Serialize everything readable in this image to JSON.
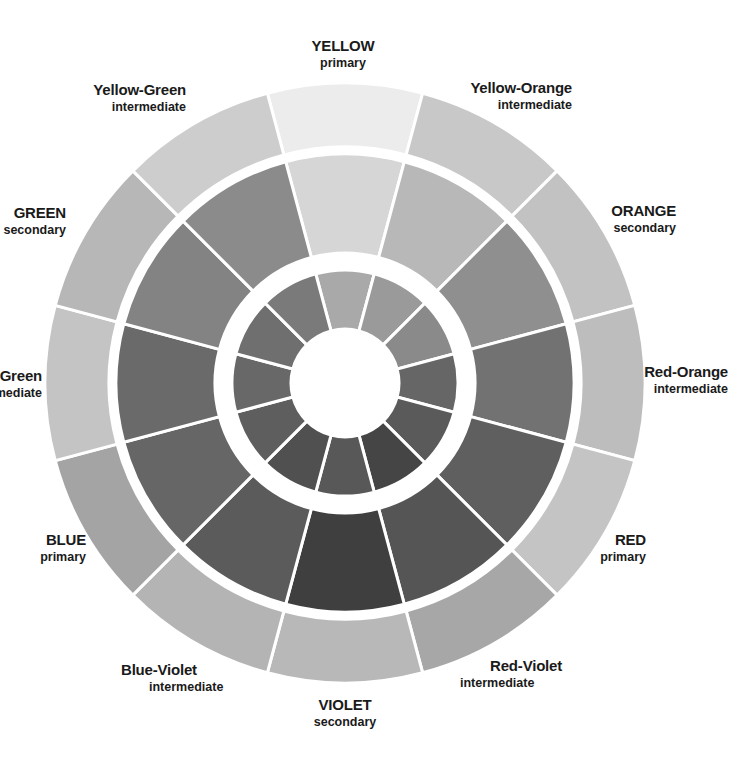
{
  "wheel": {
    "center": [
      345,
      383
    ],
    "rings": {
      "outer": {
        "r_outer": 300,
        "r_inner": 236
      },
      "middle": {
        "r_outer": 229,
        "r_inner": 130
      },
      "inner": {
        "r_outer": 113,
        "r_inner": 54
      }
    },
    "segment_count": 12,
    "segments": [
      {
        "name": "YELLOW",
        "kind": "primary",
        "angle": 0,
        "colors": {
          "outer": "#ececec",
          "middle": "#d6d6d6",
          "inner": "#a9a9a9"
        }
      },
      {
        "name": "Yellow-Orange",
        "kind": "intermediate",
        "angle": 30,
        "colors": {
          "outer": "#c8c8c8",
          "middle": "#b8b8b8",
          "inner": "#9a9a9a"
        }
      },
      {
        "name": "ORANGE",
        "kind": "secondary",
        "angle": 60,
        "colors": {
          "outer": "#c2c2c2",
          "middle": "#8f8f8f",
          "inner": "#8a8a8a"
        }
      },
      {
        "name": "Red-Orange",
        "kind": "intermediate",
        "angle": 90,
        "colors": {
          "outer": "#bdbdbd",
          "middle": "#727272",
          "inner": "#666666"
        }
      },
      {
        "name": "RED",
        "kind": "primary",
        "angle": 120,
        "colors": {
          "outer": "#c4c4c4",
          "middle": "#5f5f5f",
          "inner": "#5a5a5a"
        }
      },
      {
        "name": "Red-Violet",
        "kind": "intermediate",
        "angle": 150,
        "colors": {
          "outer": "#a7a7a7",
          "middle": "#555555",
          "inner": "#454545"
        }
      },
      {
        "name": "VIOLET",
        "kind": "secondary",
        "angle": 180,
        "colors": {
          "outer": "#b8b8b8",
          "middle": "#3f3f3f",
          "inner": "#585858"
        }
      },
      {
        "name": "Blue-Violet",
        "kind": "intermediate",
        "angle": 210,
        "colors": {
          "outer": "#b4b4b4",
          "middle": "#5b5b5b",
          "inner": "#505050"
        }
      },
      {
        "name": "BLUE",
        "kind": "primary",
        "angle": 240,
        "colors": {
          "outer": "#a4a4a4",
          "middle": "#666666",
          "inner": "#5e5e5e"
        }
      },
      {
        "name": "Blue-Green",
        "kind": "intermediate",
        "angle": 270,
        "colors": {
          "outer": "#c4c4c4",
          "middle": "#6a6a6a",
          "inner": "#686868"
        }
      },
      {
        "name": "GREEN",
        "kind": "secondary",
        "angle": 300,
        "colors": {
          "outer": "#b7b7b7",
          "middle": "#838383",
          "inner": "#6f6f6f"
        }
      },
      {
        "name": "Yellow-Green",
        "kind": "intermediate",
        "angle": 330,
        "colors": {
          "outer": "#cdcdcd",
          "middle": "#8b8b8b",
          "inner": "#7a7a7a"
        }
      }
    ]
  },
  "labels": [
    {
      "id": "yellow",
      "name": "YELLOW",
      "kind": "primary"
    },
    {
      "id": "yellow-orange",
      "name": "Yellow-Orange",
      "kind": "intermediate"
    },
    {
      "id": "orange",
      "name": "ORANGE",
      "kind": "secondary"
    },
    {
      "id": "red-orange",
      "name": "Red-Orange",
      "kind": "intermediate"
    },
    {
      "id": "red",
      "name": "RED",
      "kind": "primary"
    },
    {
      "id": "red-violet",
      "name": "Red-Violet",
      "kind": "intermediate"
    },
    {
      "id": "violet",
      "name": "VIOLET",
      "kind": "secondary"
    },
    {
      "id": "blue-violet",
      "name": "Blue-Violet",
      "kind": "intermediate"
    },
    {
      "id": "blue",
      "name": "BLUE",
      "kind": "primary"
    },
    {
      "id": "blue-green",
      "name": "Blue-Green",
      "kind": "intermediate"
    },
    {
      "id": "green",
      "name": "GREEN",
      "kind": "secondary"
    },
    {
      "id": "yellow-green",
      "name": "Yellow-Green",
      "kind": "intermediate"
    }
  ]
}
